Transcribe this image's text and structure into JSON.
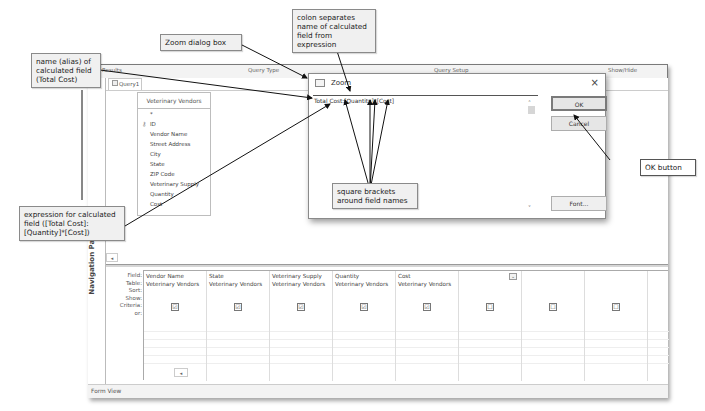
{
  "ribbon": {
    "groups": [
      "Results",
      "Query Type",
      "Query Setup",
      "Show/Hide"
    ]
  },
  "navigation_pane": {
    "label": "Navigation Pane"
  },
  "query_tab": {
    "label": "Query1"
  },
  "field_list": {
    "table_name": "Veterinary Vendors",
    "fields": [
      "*",
      "ID",
      "Vendor Name",
      "Street Address",
      "City",
      "State",
      "ZIP Code",
      "Veterinary Supply",
      "Quantity",
      "Cost"
    ]
  },
  "grid": {
    "row_labels": [
      "Field:",
      "Table:",
      "Sort:",
      "Show:",
      "Criteria:",
      "or:"
    ],
    "columns": [
      {
        "field": "Vendor Name",
        "table": "Veterinary Vendors",
        "show": true
      },
      {
        "field": "State",
        "table": "Veterinary Vendors",
        "show": true
      },
      {
        "field": "Veterinary Supply",
        "table": "Veterinary Vendors",
        "show": true
      },
      {
        "field": "Quantity",
        "table": "Veterinary Vendors",
        "show": true
      },
      {
        "field": "Cost",
        "table": "Veterinary Vendors",
        "show": true
      },
      {
        "field": "",
        "table": "",
        "show": false
      },
      {
        "field": "",
        "table": "",
        "show": false
      },
      {
        "field": "",
        "table": "",
        "show": false
      }
    ],
    "check_glyph": "☑",
    "uncheck_glyph": "☐"
  },
  "status_bar": {
    "text": "Form View"
  },
  "zoom_dialog": {
    "title": "Zoom",
    "expression": "Total Cost:[Quantity]*[Cost]",
    "ok_label": "OK",
    "cancel_label": "Cancel",
    "font_label": "Font...",
    "close_glyph": "×"
  },
  "callouts": {
    "alias": "name (alias) of calculated field (Total Cost)",
    "zoom_dialog": "Zoom dialog box",
    "colon": "colon separates name of calculated field from expression",
    "ok_button": "OK button",
    "expression": "expression for calculated field ([Total Cost]:[Quantity]*[Cost])",
    "brackets": "square brackets around field names"
  }
}
